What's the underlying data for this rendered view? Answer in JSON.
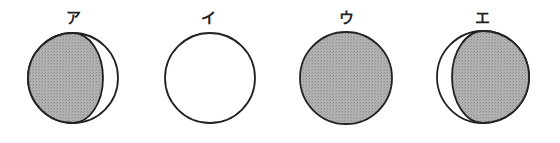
{
  "figures": [
    {
      "label": "ア",
      "phase": "gibbous-shadow-left",
      "cx": 73,
      "cy": 78,
      "r": 45,
      "terminator_rx": 30,
      "shaded_side": "left"
    },
    {
      "label": "イ",
      "phase": "full-unshaded",
      "cx": 210,
      "cy": 78,
      "r": 45
    },
    {
      "label": "ウ",
      "phase": "fully-shaded",
      "cx": 346,
      "cy": 78,
      "r": 46
    },
    {
      "label": "エ",
      "phase": "gibbous-shadow-right",
      "cx": 483,
      "cy": 77,
      "r": 46,
      "terminator_rx": 31,
      "shaded_side": "right"
    }
  ],
  "colors": {
    "shade": "#a9a9a9",
    "stroke": "#222222",
    "background": "#ffffff"
  }
}
